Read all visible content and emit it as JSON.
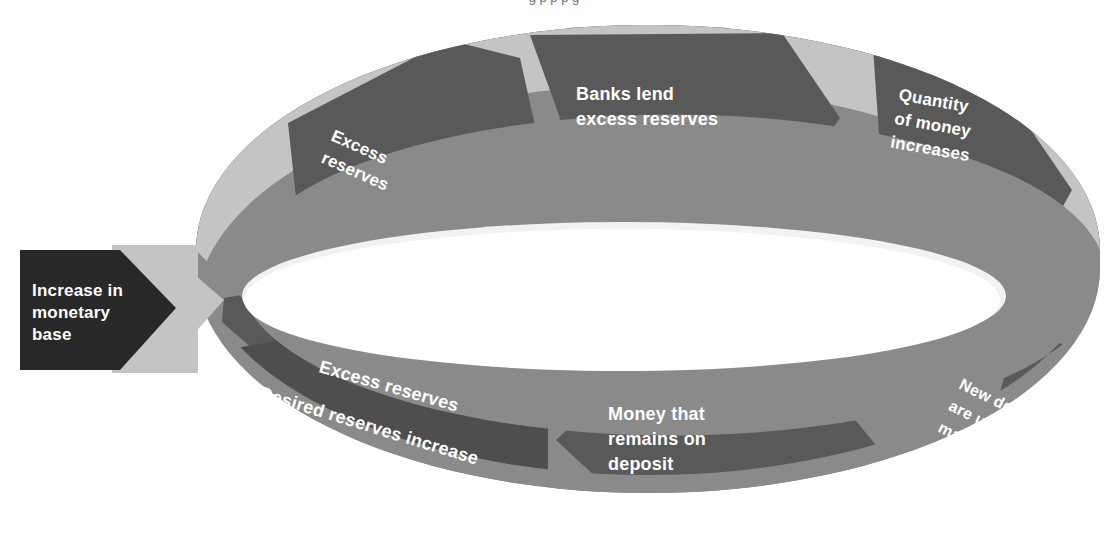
{
  "figure": {
    "title_fragment": "g p    p  p   g",
    "type": "cycle-diagram"
  },
  "colors": {
    "band_dark": "#595959",
    "band_darker": "#4e4e4e",
    "band_light": "#c4c4c4",
    "band_light_shadow": "#b0b0b0",
    "band_mid": "#8a8a8a",
    "input_box": "#282828",
    "input_box_halo": "#c4c4c4",
    "label_text": "#ffffff",
    "inner_fill": "#ffffff",
    "background": "#ffffff"
  },
  "input": {
    "label": "Increase in\nmonetary\nbase",
    "lines": [
      "Increase in",
      "monetary",
      "base"
    ],
    "shape": "right-pointing-arrow",
    "direction": "right"
  },
  "cycle": {
    "back_row_direction": "clockwise-right",
    "front_row_direction": "counterclockwise-left",
    "steps": [
      {
        "id": "excess-reserves-top",
        "lines": [
          "Excess",
          "reserves"
        ],
        "row": "back",
        "order": 1,
        "tone": "dark",
        "arrow": "right"
      },
      {
        "id": "banks-lend",
        "lines": [
          "Banks lend",
          "excess reserves"
        ],
        "row": "back",
        "order": 2,
        "tone": "dark",
        "arrow": "right"
      },
      {
        "id": "quantity-of-money",
        "lines": [
          "Quantity",
          "of money",
          "increases"
        ],
        "row": "back",
        "order": 3,
        "tone": "dark",
        "arrow": "right"
      },
      {
        "id": "new-deposits",
        "lines": [
          "New deposits",
          "are used to",
          "make payments"
        ],
        "row": "front",
        "order": 4,
        "tone": "dark",
        "arrow": "left"
      },
      {
        "id": "money-remains-on-deposit",
        "lines": [
          "Money that",
          "remains on",
          "deposit"
        ],
        "row": "front",
        "order": 5,
        "tone": "dark",
        "arrow": "left"
      },
      {
        "id": "currency-drain",
        "lines": [
          "Currency drain"
        ],
        "row": "front",
        "order": 6,
        "tone": "light",
        "arrow": "left"
      },
      {
        "id": "excess-reserves-front",
        "lines": [
          "Excess reserves"
        ],
        "row": "front",
        "order": 7,
        "tone": "dark",
        "arrow": "left"
      },
      {
        "id": "desired-reserves",
        "lines": [
          "Desired reserves increase"
        ],
        "row": "front",
        "order": 8,
        "tone": "darker",
        "arrow": "left"
      }
    ]
  },
  "labels": {
    "increase_l1": "Increase in",
    "increase_l2": "monetary",
    "increase_l3": "base",
    "excess_top_l1": "Excess",
    "excess_top_l2": "reserves",
    "banks_l1": "Banks lend",
    "banks_l2": "excess reserves",
    "qty_l1": "Quantity",
    "qty_l2": "of money",
    "qty_l3": "increases",
    "newdep_l1": "New deposits",
    "newdep_l2": "are used to",
    "newdep_l3": "make payments",
    "money_l1": "Money that",
    "money_l2": "remains on",
    "money_l3": "deposit",
    "currency": "Currency drain",
    "excess_front": "Excess reserves",
    "desired": "Desired reserves increase"
  }
}
